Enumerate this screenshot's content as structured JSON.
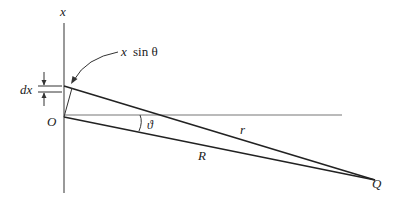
{
  "diagram": {
    "labels": {
      "axis": "x",
      "annotation_var": "x",
      "annotation_fn": "sin θ",
      "dx": "dx",
      "origin": "O",
      "angle": "ϑ",
      "r": "r",
      "R": "R",
      "Q": "Q"
    },
    "colors": {
      "line": "#222222",
      "axis": "#555555",
      "reference": "#777777"
    }
  }
}
